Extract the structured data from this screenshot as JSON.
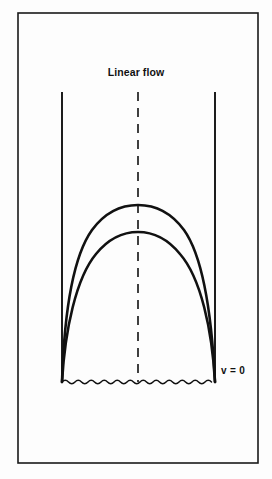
{
  "figure": {
    "title": "Linear flow",
    "frame": {
      "x": 18,
      "y": 13,
      "width": 240,
      "height": 450,
      "stroke_color": "#1a1a1a",
      "stroke_width": 1.6,
      "fill_color": "#fdfdfd"
    },
    "background_color": "#fdfdfd",
    "ink_color": "#111111"
  },
  "annotations": {
    "velocity_zero": "v = 0"
  },
  "diagram_elements": {
    "left_wall": {
      "name": "left-wall",
      "x": 62,
      "y_top": 92,
      "y_bottom": 382,
      "stroke_width": 1.9
    },
    "right_wall": {
      "name": "right-wall",
      "x": 215,
      "y_top": 92,
      "y_bottom": 382,
      "stroke_width": 1.9
    },
    "centerline": {
      "name": "center-axis",
      "x": 138,
      "y_top": 92,
      "y_bottom": 382,
      "dash": "9 7",
      "stroke_width": 1.6
    },
    "baseline": {
      "name": "wavy-baseline",
      "y": 382,
      "x_start": 62,
      "x_end": 215,
      "amplitude": 2.0,
      "wavelength": 13
    },
    "profile_outer": {
      "name": "outer-velocity-profile",
      "apex_x": 138,
      "apex_y": 210,
      "base_left_x": 62,
      "base_right_x": 215,
      "base_y": 382,
      "stroke_width": 2.6
    },
    "profile_inner": {
      "name": "inner-velocity-profile",
      "apex_x": 138,
      "apex_y": 235,
      "base_left_x": 62,
      "base_right_x": 215,
      "base_y": 382,
      "stroke_width": 2.6
    }
  }
}
